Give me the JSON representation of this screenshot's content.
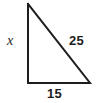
{
  "figure": {
    "name": "right-triangle",
    "background_color": "#ffffff",
    "stroke_color": "#1d1d1d",
    "stroke_width": 2,
    "text_color": "#1d1d1d",
    "vertices": {
      "apex": {
        "x": 28,
        "y": 4
      },
      "bottom_left": {
        "x": 28,
        "y": 83
      },
      "bottom_right": {
        "x": 90,
        "y": 83
      }
    },
    "labels": {
      "vertical_leg": "x",
      "hypotenuse": "25",
      "base": "15"
    }
  },
  "chart_data": {
    "type": "diagram",
    "title": "",
    "shape": "right triangle",
    "sides": [
      {
        "name": "vertical-leg",
        "label": "x",
        "known": false,
        "position": "left"
      },
      {
        "name": "hypotenuse",
        "label": "25",
        "value": 25,
        "known": true,
        "position": "upper-right"
      },
      {
        "name": "base",
        "label": "15",
        "value": 15,
        "known": true,
        "position": "bottom"
      }
    ],
    "right_angle_at": "bottom-left"
  }
}
